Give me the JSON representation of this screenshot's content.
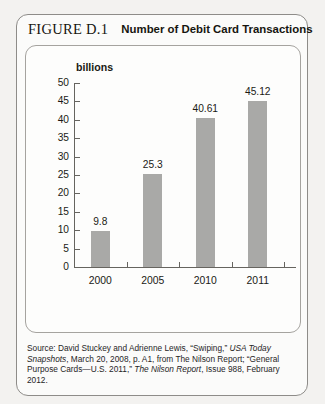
{
  "figure": {
    "number_label": "FIGURE D.1",
    "title": "Number of Debit Card Transactions"
  },
  "source": {
    "line1_prefix": "Source: David Stuckey and Adrienne Lewis, “Swiping,” ",
    "line1_italic": "USA Today Snapshots",
    "line1_suffix": ",",
    "line2": "March 20, 2008, p. A1, from The Nilson Report; “General Purpose Cards—U.S.",
    "line3_prefix": "2011,” ",
    "line3_italic": "The Nilson Report",
    "line3_suffix": ", Issue 988, February 2012."
  },
  "chart_data": {
    "type": "bar",
    "title": "Number of Debit Card Transactions",
    "categories": [
      "2000",
      "2005",
      "2010",
      "2011"
    ],
    "values": [
      9.8,
      25.3,
      40.61,
      45.12
    ],
    "value_labels": [
      "9.8",
      "25.3",
      "40.61",
      "45.12"
    ],
    "xlabel": "",
    "ylabel": "billions",
    "ylim": [
      0,
      50
    ],
    "yticks": [
      0,
      5,
      10,
      15,
      20,
      25,
      30,
      35,
      40,
      45,
      50
    ],
    "ytick_labels": [
      "0",
      "5",
      "10",
      "15",
      "20",
      "25",
      "30",
      "35",
      "40",
      "45",
      "50"
    ],
    "grid": false,
    "legend": false,
    "bar_color": "#a9a9a7",
    "axis_color": "#66645f"
  }
}
